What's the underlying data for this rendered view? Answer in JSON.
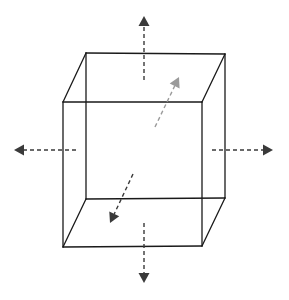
{
  "diagram": {
    "title": "",
    "colors": {
      "background": "#ffffff",
      "cube_edge": "#1a1a1a",
      "arrow_dark": "#3a3a3a",
      "arrow_light": "#9a9a9a"
    },
    "cube": {
      "front_top_left": [
        63,
        102
      ],
      "front_top_right": [
        202,
        102
      ],
      "front_bottom_left": [
        63,
        247
      ],
      "front_bottom_right": [
        202,
        246
      ],
      "back_top_left": [
        86,
        53
      ],
      "back_top_right": [
        225,
        54
      ],
      "back_bottom_left": [
        86,
        199
      ],
      "back_bottom_right": [
        225,
        198
      ]
    },
    "arrows": [
      {
        "name": "up",
        "from": [
          144,
          80
        ],
        "to": [
          144,
          16
        ],
        "shade": "dark"
      },
      {
        "name": "down",
        "from": [
          144,
          223
        ],
        "to": [
          144,
          283
        ],
        "shade": "dark"
      },
      {
        "name": "left",
        "from": [
          76,
          150
        ],
        "to": [
          14,
          150
        ],
        "shade": "dark"
      },
      {
        "name": "right",
        "from": [
          212,
          150
        ],
        "to": [
          273,
          150
        ],
        "shade": "dark"
      },
      {
        "name": "back",
        "from": [
          155,
          127
        ],
        "to": [
          179,
          77
        ],
        "shade": "light"
      },
      {
        "name": "front",
        "from": [
          133,
          174
        ],
        "to": [
          110,
          223
        ],
        "shade": "dark"
      }
    ]
  }
}
